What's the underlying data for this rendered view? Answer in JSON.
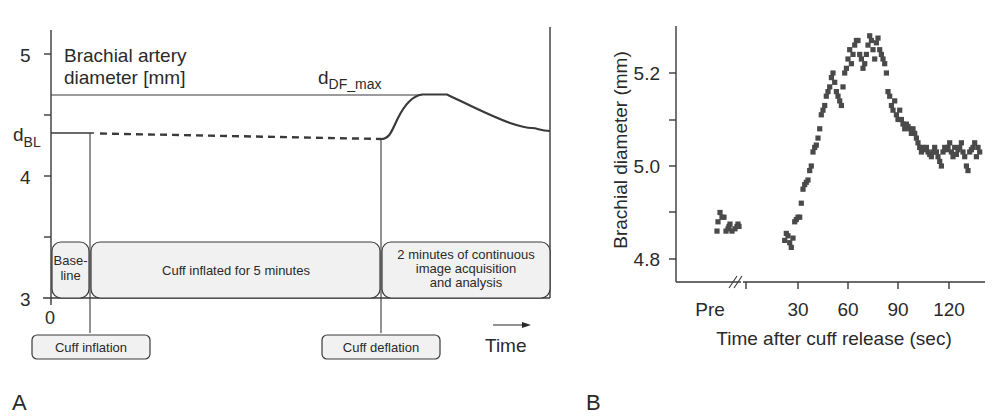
{
  "panel_labels": {
    "a": "A",
    "b": "B"
  },
  "chart_data": [
    {
      "type": "line",
      "panel": "A",
      "title": "",
      "ylabel": "Brachial artery diameter [mm]",
      "ylabel_line1": "Brachial artery",
      "ylabel_line2": "diameter [mm]",
      "xlabel": "Time",
      "y_ticks": [
        "5",
        "4",
        "3"
      ],
      "x_ticks": [
        "0"
      ],
      "ylim": [
        3,
        5.2
      ],
      "annotations": {
        "baseline_label": "d",
        "baseline_sub": "BL",
        "max_label": "d",
        "max_sub": "DF_max"
      },
      "phases": [
        {
          "line1": "Base-",
          "line2": "line",
          "line3": ""
        },
        {
          "line1": "Cuff inflated for 5 minutes",
          "line2": "",
          "line3": ""
        },
        {
          "line1": "2 minutes of continuous",
          "line2": "image acquisition",
          "line3": "and analysis"
        }
      ],
      "events": {
        "inflation": "Cuff inflation",
        "deflation": "Cuff deflation"
      },
      "series": [
        {
          "name": "baseline (solid)",
          "points": [
            [
              0,
              4.35
            ],
            [
              0.33,
              4.35
            ]
          ]
        },
        {
          "name": "during inflation (dashed)",
          "points": [
            [
              0.33,
              4.35
            ],
            [
              2.8,
              4.31
            ]
          ]
        },
        {
          "name": "post-deflation",
          "points": [
            [
              2.8,
              4.31
            ],
            [
              3.0,
              4.45
            ],
            [
              3.15,
              4.62
            ],
            [
              3.35,
              4.63
            ],
            [
              3.6,
              4.55
            ],
            [
              3.9,
              4.46
            ],
            [
              4.1,
              4.42
            ],
            [
              4.2,
              4.39
            ]
          ]
        }
      ],
      "d_BL": 4.35,
      "d_DF_max": 4.63
    },
    {
      "type": "scatter",
      "panel": "B",
      "title": "",
      "xlabel": "Time after cuff release (sec)",
      "ylabel": "Brachial diameter (mm)",
      "x_ticks": [
        "Pre",
        "30",
        "60",
        "90",
        "120"
      ],
      "y_ticks": [
        "5.2",
        "5.0",
        "4.8"
      ],
      "ylim": [
        4.75,
        5.3
      ],
      "xlim": [
        "Pre",
        140
      ],
      "axis_break": "//",
      "series": [
        {
          "name": "pre",
          "points": [
            [
              -45,
              4.86
            ],
            [
              -44,
              4.88
            ],
            [
              -42,
              4.9
            ],
            [
              -40,
              4.89
            ],
            [
              -38,
              4.89
            ],
            [
              -36,
              4.86
            ],
            [
              -34,
              4.865
            ],
            [
              -33,
              4.87
            ],
            [
              -32,
              4.875
            ],
            [
              -30,
              4.86
            ],
            [
              -27,
              4.865
            ],
            [
              -25,
              4.87
            ],
            [
              -24,
              4.875
            ],
            [
              -23,
              4.87
            ]
          ]
        },
        {
          "name": "post",
          "points": [
            [
              22,
              4.84
            ],
            [
              23,
              4.855
            ],
            [
              24,
              4.85
            ],
            [
              25,
              4.835
            ],
            [
              26,
              4.825
            ],
            [
              27,
              4.845
            ],
            [
              28,
              4.88
            ],
            [
              29,
              4.885
            ],
            [
              30,
              4.89
            ],
            [
              31,
              4.89
            ],
            [
              32,
              4.92
            ],
            [
              33,
              4.95
            ],
            [
              34,
              4.96
            ],
            [
              35,
              4.965
            ],
            [
              36,
              4.97
            ],
            [
              37,
              4.99
            ],
            [
              38,
              5.0
            ],
            [
              39,
              5.03
            ],
            [
              40,
              5.04
            ],
            [
              41,
              5.045
            ],
            [
              42,
              5.06
            ],
            [
              43,
              5.08
            ],
            [
              44,
              5.11
            ],
            [
              45,
              5.12
            ],
            [
              46,
              5.13
            ],
            [
              47,
              5.15
            ],
            [
              48,
              5.16
            ],
            [
              49,
              5.17
            ],
            [
              50,
              5.19
            ],
            [
              51,
              5.2
            ],
            [
              52,
              5.18
            ],
            [
              53,
              5.16
            ],
            [
              54,
              5.15
            ],
            [
              55,
              5.14
            ],
            [
              56,
              5.13
            ],
            [
              57,
              5.17
            ],
            [
              58,
              5.2
            ],
            [
              59,
              5.21
            ],
            [
              60,
              5.23
            ],
            [
              61,
              5.25
            ],
            [
              62,
              5.22
            ],
            [
              63,
              5.24
            ],
            [
              64,
              5.26
            ],
            [
              65,
              5.27
            ],
            [
              66,
              5.27
            ],
            [
              67,
              5.24
            ],
            [
              68,
              5.23
            ],
            [
              69,
              5.21
            ],
            [
              70,
              5.22
            ],
            [
              71,
              5.24
            ],
            [
              72,
              5.26
            ],
            [
              73,
              5.28
            ],
            [
              74,
              5.27
            ],
            [
              75,
              5.25
            ],
            [
              76,
              5.23
            ],
            [
              77,
              5.265
            ],
            [
              78,
              5.275
            ],
            [
              79,
              5.25
            ],
            [
              80,
              5.24
            ],
            [
              81,
              5.23
            ],
            [
              82,
              5.22
            ],
            [
              83,
              5.2
            ],
            [
              84,
              5.16
            ],
            [
              85,
              5.15
            ],
            [
              86,
              5.13
            ],
            [
              87,
              5.12
            ],
            [
              88,
              5.14
            ],
            [
              89,
              5.11
            ],
            [
              90,
              5.1
            ],
            [
              91,
              5.12
            ],
            [
              92,
              5.1
            ],
            [
              93,
              5.09
            ],
            [
              94,
              5.08
            ],
            [
              95,
              5.09
            ],
            [
              96,
              5.085
            ],
            [
              97,
              5.08
            ],
            [
              98,
              5.07
            ],
            [
              99,
              5.08
            ],
            [
              100,
              5.07
            ],
            [
              101,
              5.06
            ],
            [
              102,
              5.05
            ],
            [
              103,
              5.04
            ],
            [
              104,
              5.03
            ],
            [
              105,
              5.04
            ],
            [
              106,
              5.035
            ],
            [
              107,
              5.04
            ],
            [
              108,
              5.03
            ],
            [
              109,
              5.025
            ],
            [
              110,
              5.02
            ],
            [
              111,
              5.03
            ],
            [
              112,
              5.04
            ],
            [
              113,
              5.03
            ],
            [
              114,
              5.02
            ],
            [
              115,
              5.01
            ],
            [
              116,
              5.0
            ],
            [
              117,
              5.03
            ],
            [
              118,
              5.04
            ],
            [
              119,
              5.035
            ],
            [
              120,
              5.04
            ],
            [
              121,
              5.05
            ],
            [
              122,
              5.03
            ],
            [
              123,
              5.02
            ],
            [
              124,
              5.04
            ],
            [
              125,
              5.025
            ],
            [
              126,
              5.035
            ],
            [
              127,
              5.04
            ],
            [
              128,
              5.05
            ],
            [
              129,
              5.03
            ],
            [
              130,
              5.02
            ],
            [
              131,
              5.0
            ],
            [
              132,
              4.99
            ],
            [
              133,
              5.03
            ],
            [
              134,
              5.035
            ],
            [
              135,
              5.04
            ],
            [
              136,
              5.05
            ],
            [
              137,
              5.02
            ],
            [
              138,
              5.04
            ],
            [
              139,
              5.03
            ]
          ]
        }
      ]
    }
  ]
}
